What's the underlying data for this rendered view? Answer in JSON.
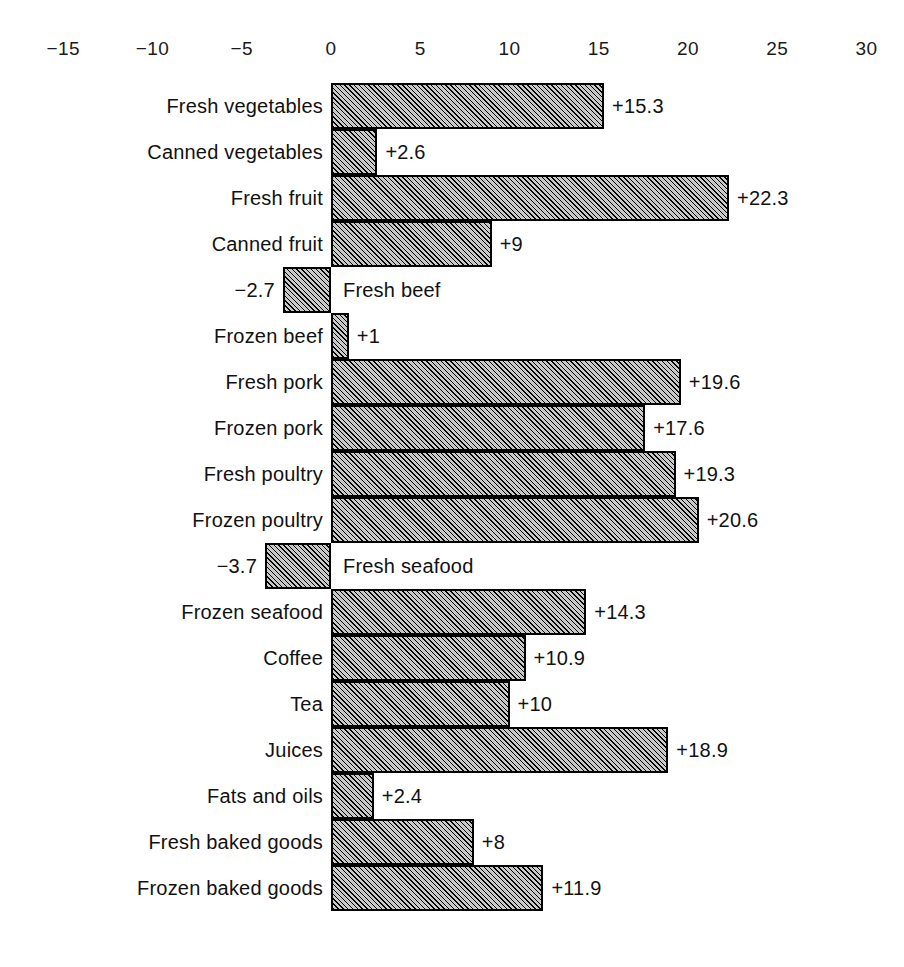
{
  "chart_data": {
    "type": "bar",
    "orientation": "horizontal",
    "title": "",
    "subtitle": "",
    "xlabel": "",
    "ylabel": "",
    "xlim": [
      -17.5,
      32.5
    ],
    "grid": false,
    "legend": null,
    "axis_position": "top",
    "tick_labels": [
      "−15",
      "−10",
      "−5",
      "0",
      "5",
      "10",
      "15",
      "20",
      "25",
      "30"
    ],
    "tick_values": [
      -15,
      -10,
      -5,
      0,
      5,
      10,
      15,
      20,
      25,
      30
    ],
    "categories": [
      "Fresh vegetables",
      "Canned vegetables",
      "Fresh fruit",
      "Canned fruit",
      "Fresh beef",
      "Frozen beef",
      "Fresh pork",
      "Frozen pork",
      "Fresh poultry",
      "Frozen poultry",
      "Fresh seafood",
      "Frozen seafood",
      "Coffee",
      "Tea",
      "Juices",
      "Fats and oils",
      "Fresh baked goods",
      "Frozen baked goods"
    ],
    "values": [
      15.3,
      2.6,
      22.3,
      9,
      -2.7,
      1,
      19.6,
      17.6,
      19.3,
      20.6,
      -3.7,
      14.3,
      10.9,
      10,
      18.9,
      2.4,
      8,
      11.9
    ],
    "value_labels": [
      "+15.3",
      "+2.6",
      "+22.3",
      "+9",
      "−2.7",
      "+1",
      "+19.6",
      "+17.6",
      "+19.3",
      "+20.6",
      "−3.7",
      "+14.3",
      "+10.9",
      "+10",
      "+18.9",
      "+2.4",
      "+8",
      "+11.9"
    ],
    "bars": [
      {
        "category": "Fresh vegetables",
        "value": 15.3,
        "value_label": "+15.3"
      },
      {
        "category": "Canned vegetables",
        "value": 2.6,
        "value_label": "+2.6"
      },
      {
        "category": "Fresh fruit",
        "value": 22.3,
        "value_label": "+22.3"
      },
      {
        "category": "Canned fruit",
        "value": 9,
        "value_label": "+9"
      },
      {
        "category": "Fresh beef",
        "value": -2.7,
        "value_label": "−2.7"
      },
      {
        "category": "Frozen beef",
        "value": 1,
        "value_label": "+1"
      },
      {
        "category": "Fresh pork",
        "value": 19.6,
        "value_label": "+19.6"
      },
      {
        "category": "Frozen pork",
        "value": 17.6,
        "value_label": "+17.6"
      },
      {
        "category": "Fresh poultry",
        "value": 19.3,
        "value_label": "+19.3"
      },
      {
        "category": "Frozen poultry",
        "value": 20.6,
        "value_label": "+20.6"
      },
      {
        "category": "Fresh seafood",
        "value": -3.7,
        "value_label": "−3.7"
      },
      {
        "category": "Frozen seafood",
        "value": 14.3,
        "value_label": "+14.3"
      },
      {
        "category": "Coffee",
        "value": 10.9,
        "value_label": "+10.9"
      },
      {
        "category": "Tea",
        "value": 10,
        "value_label": "+10"
      },
      {
        "category": "Juices",
        "value": 18.9,
        "value_label": "+18.9"
      },
      {
        "category": "Fats and oils",
        "value": 2.4,
        "value_label": "+2.4"
      },
      {
        "category": "Fresh baked goods",
        "value": 8,
        "value_label": "+8"
      },
      {
        "category": "Frozen baked goods",
        "value": 11.9,
        "value_label": "+11.9"
      }
    ],
    "colors": {
      "bar_fill": "#c9c9c9",
      "bar_hatch": "#000000",
      "bar_outline": "#000000",
      "text": "#111111",
      "background": "#ffffff"
    }
  },
  "geometry": {
    "zero_x": 331,
    "px_per_unit": 17.85,
    "first_bar_top": 83,
    "bar_height": 46,
    "label_gap": 8
  }
}
